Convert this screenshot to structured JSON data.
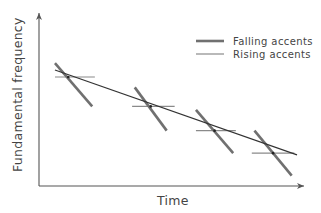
{
  "title": "",
  "axes": {
    "x_label": "Time",
    "y_label": "Fundamental frequency"
  },
  "legend": {
    "position": "top-right",
    "items": [
      {
        "key": "falling",
        "label": "Falling accents",
        "style": "thick"
      },
      {
        "key": "rising",
        "label": "Rising accents",
        "style": "thin"
      }
    ]
  },
  "colors": {
    "axis": "#555555",
    "declination": "#333333",
    "falling": "#707070",
    "rising": "#8a8a8a",
    "text": "#444444"
  },
  "declination_line": {
    "description": "Overall downward trend of fundamental frequency over time",
    "start": {
      "time": 0.06,
      "f0": 0.67
    },
    "end": {
      "time": 0.97,
      "f0": 0.18
    }
  },
  "accents": [
    {
      "id": 1,
      "time": 0.11,
      "f0": 0.63,
      "falling": {
        "from": {
          "time": 0.06,
          "f0": 0.71
        },
        "to": {
          "time": 0.2,
          "f0": 0.46
        }
      },
      "rising": {
        "from": {
          "time": 0.06,
          "f0": 0.63
        },
        "to": {
          "time": 0.21,
          "f0": 0.63
        }
      }
    },
    {
      "id": 2,
      "time": 0.42,
      "f0": 0.46,
      "falling": {
        "from": {
          "time": 0.36,
          "f0": 0.57
        },
        "to": {
          "time": 0.48,
          "f0": 0.32
        }
      },
      "rising": {
        "from": {
          "time": 0.35,
          "f0": 0.46
        },
        "to": {
          "time": 0.51,
          "f0": 0.46
        }
      }
    },
    {
      "id": 3,
      "time": 0.66,
      "f0": 0.32,
      "falling": {
        "from": {
          "time": 0.59,
          "f0": 0.44
        },
        "to": {
          "time": 0.73,
          "f0": 0.19
        }
      },
      "rising": {
        "from": {
          "time": 0.59,
          "f0": 0.32
        },
        "to": {
          "time": 0.74,
          "f0": 0.32
        }
      }
    },
    {
      "id": 4,
      "time": 0.88,
      "f0": 0.19,
      "falling": {
        "from": {
          "time": 0.81,
          "f0": 0.32
        },
        "to": {
          "time": 0.95,
          "f0": 0.06
        }
      },
      "rising": {
        "from": {
          "time": 0.8,
          "f0": 0.19
        },
        "to": {
          "time": 0.96,
          "f0": 0.19
        }
      }
    }
  ]
}
